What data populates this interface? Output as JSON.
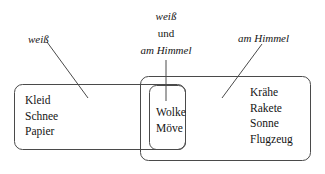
{
  "diagram": {
    "type": "venn-two-set-overlap",
    "title_visible": false,
    "background_color": "#ffffff",
    "stroke_color": "#4a4a4a",
    "text_color": "#141414",
    "sets": [
      {
        "id": "set-weiss",
        "label": "weiß",
        "label_style": "italic",
        "label_position": "upper-left",
        "box": {
          "x": 14,
          "y": 84,
          "width": 172,
          "height": 66,
          "radius": 8
        },
        "leader_line": {
          "x1": 47,
          "y1": 42,
          "x2": 88,
          "y2": 98
        }
      },
      {
        "id": "set-am-himmel",
        "label": "am Himmel",
        "label_style": "italic",
        "label_position": "upper-right",
        "box": {
          "x": 140,
          "y": 76,
          "width": 171,
          "height": 85,
          "radius": 8
        },
        "leader_line": {
          "x1": 222,
          "y1": 98,
          "x2": 262,
          "y2": 44
        }
      }
    ],
    "intersection": {
      "id": "set-intersection",
      "labels": [
        "weiß",
        "und",
        "am Himmel"
      ],
      "label_styles": [
        "italic",
        "roman",
        "italic"
      ],
      "label_position": "top-center",
      "box": {
        "x": 149,
        "y": 85,
        "width": 37,
        "height": 65,
        "radius": 7
      },
      "leader_line": {
        "x1": 166,
        "y1": 60,
        "x2": 166,
        "y2": 101
      }
    },
    "regions": [
      {
        "id": "region-left-only",
        "name": "weiß-only",
        "members": [
          "Kleid",
          "Schnee",
          "Papier"
        ]
      },
      {
        "id": "region-intersection",
        "name": "weiß-und-am-Himmel",
        "members": [
          "Wolke",
          "Möve"
        ]
      },
      {
        "id": "region-right-only",
        "name": "am-Himmel-only",
        "members": [
          "Krähe",
          "Rakete",
          "Sonne",
          "Flugzeug"
        ]
      }
    ]
  }
}
